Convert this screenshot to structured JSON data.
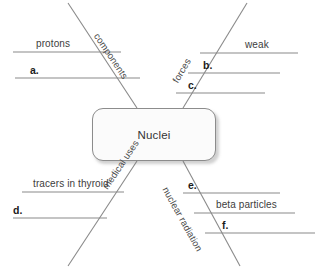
{
  "diagram": {
    "type": "concept-map",
    "center": {
      "label": "Nuclei"
    },
    "branches": [
      {
        "id": "components",
        "label": "components",
        "position": "top-left"
      },
      {
        "id": "forces",
        "label": "forces",
        "position": "top-right"
      },
      {
        "id": "medical-uses",
        "label": "medical uses",
        "position": "bottom-left"
      },
      {
        "id": "nuclear-radiation",
        "label": "nuclear radiation",
        "position": "bottom-right"
      }
    ],
    "entries": [
      {
        "id": "protons",
        "label": "protons",
        "branch": "components",
        "filled": true
      },
      {
        "id": "a",
        "label": "a.",
        "branch": "components",
        "filled": false
      },
      {
        "id": "weak",
        "label": "weak",
        "branch": "forces",
        "filled": true
      },
      {
        "id": "b",
        "label": "b.",
        "branch": "forces",
        "filled": false
      },
      {
        "id": "c",
        "label": "c.",
        "branch": "forces",
        "filled": false
      },
      {
        "id": "tracers",
        "label": "tracers in thyroid",
        "branch": "medical-uses",
        "filled": true
      },
      {
        "id": "d",
        "label": "d.",
        "branch": "medical-uses",
        "filled": false
      },
      {
        "id": "e",
        "label": "e.",
        "branch": "nuclear-radiation",
        "filled": false
      },
      {
        "id": "beta-particles",
        "label": "beta particles",
        "branch": "nuclear-radiation",
        "filled": true
      },
      {
        "id": "f",
        "label": "f.",
        "branch": "nuclear-radiation",
        "filled": false
      }
    ]
  },
  "colors": {
    "line": "#8a8a8a",
    "node_border": "#8c8c8c",
    "node_fill": "#fbfbfb",
    "text": "#3d3d3d",
    "blank_text": "#1c1c1c"
  }
}
